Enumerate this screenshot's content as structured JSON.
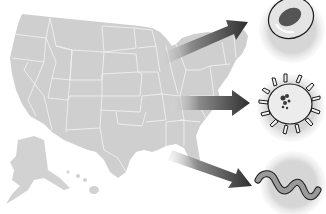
{
  "figure": {
    "colors": {
      "background": "#ffffff",
      "map_fill": "#cfcfcf",
      "state_border": "#f2f2f2",
      "arrow_dark": "#3a3a3a",
      "arrow_light": "#d8d8d8",
      "vignette": "#dadada",
      "organism_outline": "#1a1a1a",
      "nucleus": "#555555",
      "worm_fill": "#9a9a9a"
    },
    "map": {
      "name": "us-map",
      "includes": [
        "contiguous-us",
        "alaska",
        "hawaii"
      ]
    },
    "arrows": [
      {
        "name": "arrow-to-cell",
        "from": "north-central-us",
        "to": "top-circle"
      },
      {
        "name": "arrow-to-spiky-organism",
        "from": "central-us",
        "to": "middle-circle"
      },
      {
        "name": "arrow-to-worm",
        "from": "gulf-coast",
        "to": "bottom-circle"
      }
    ],
    "organisms": [
      {
        "name": "cell",
        "icon": "cell-icon",
        "position": "top"
      },
      {
        "name": "spiky-microbe",
        "icon": "microbe-icon",
        "position": "middle"
      },
      {
        "name": "worm",
        "icon": "worm-icon",
        "position": "bottom"
      }
    ]
  }
}
